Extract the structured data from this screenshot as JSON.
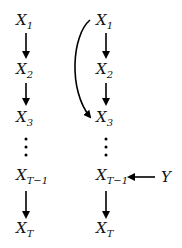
{
  "diagram": {
    "left_chain": {
      "nodes": [
        {
          "id": "L1",
          "base": "X",
          "sub": "1"
        },
        {
          "id": "L2",
          "base": "X",
          "sub": "2"
        },
        {
          "id": "L3",
          "base": "X",
          "sub": "3"
        },
        {
          "id": "LT1",
          "base": "X",
          "sub": "T−1"
        },
        {
          "id": "LT",
          "base": "X",
          "sub": "T"
        }
      ],
      "ellipsis": "⋮",
      "edges": [
        [
          "L1",
          "L2"
        ],
        [
          "L2",
          "L3"
        ],
        [
          "LT1",
          "LT"
        ]
      ]
    },
    "right_chain": {
      "nodes": [
        {
          "id": "R1",
          "base": "X",
          "sub": "1"
        },
        {
          "id": "R2",
          "base": "X",
          "sub": "2"
        },
        {
          "id": "R3",
          "base": "X",
          "sub": "3"
        },
        {
          "id": "RT1",
          "base": "X",
          "sub": "T−1"
        },
        {
          "id": "RT",
          "base": "X",
          "sub": "T"
        }
      ],
      "ellipsis": "⋮",
      "edges": [
        [
          "R1",
          "R2"
        ],
        [
          "R2",
          "R3"
        ],
        [
          "RT1",
          "RT"
        ],
        [
          "R1",
          "R3",
          "curved"
        ],
        [
          "Y",
          "RT1"
        ]
      ]
    },
    "external_node": {
      "id": "Y",
      "label": "Y"
    },
    "edge_color": "#000000"
  }
}
